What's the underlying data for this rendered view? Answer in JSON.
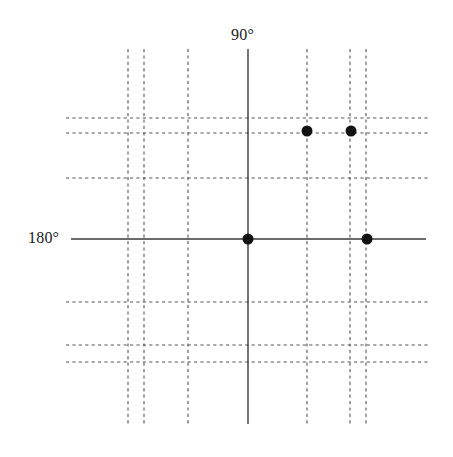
{
  "figure": {
    "title": "",
    "background_color": "#ffffff",
    "width": 453,
    "height": 457
  },
  "labels": {
    "top_axis": "90°",
    "left_axis": "180°"
  },
  "chart_data": {
    "type": "scatter",
    "title": "",
    "subtitle": "",
    "xlabel": "",
    "ylabel": "",
    "axis_labels": [
      "90°",
      "180°"
    ],
    "annotations": [
      {
        "text": "90°",
        "x": 248,
        "y": 37,
        "anchor": "middle",
        "role": "vertical-axis-label"
      },
      {
        "text": "180°",
        "x": 52,
        "y": 239,
        "anchor": "middle",
        "role": "horizontal-axis-label"
      }
    ],
    "grid": true,
    "grid_style": "dashed",
    "grid_color": "#555555",
    "legend": false,
    "axes": {
      "vertical_solid": {
        "x": 248,
        "y_start": 49,
        "y_end": 424,
        "color": "#3a3a3a",
        "width": 1.4
      },
      "horizontal_solid": {
        "y": 239,
        "x_start": 71,
        "x_end": 426,
        "color": "#3a3a3a",
        "width": 1.4
      }
    },
    "xlim": [
      66,
      428
    ],
    "ylim": [
      49,
      424
    ],
    "gridlines_x": [
      128,
      144,
      188,
      307,
      350,
      366
    ],
    "gridlines_y": [
      118,
      133,
      178,
      302,
      345,
      362
    ],
    "gridline_extent_x": [
      66,
      428
    ],
    "gridline_extent_y": [
      49,
      424
    ],
    "marker": {
      "shape": "circle",
      "color": "#121212",
      "radius": 5.5
    },
    "points": [
      {
        "x": 307,
        "y": 131,
        "label": ""
      },
      {
        "x": 351,
        "y": 131,
        "label": ""
      },
      {
        "x": 248,
        "y": 239,
        "label": ""
      },
      {
        "x": 367,
        "y": 239,
        "label": ""
      }
    ],
    "values": [
      {
        "px_x": 307,
        "px_y": 131
      },
      {
        "px_x": 351,
        "px_y": 131
      },
      {
        "px_x": 248,
        "px_y": 239
      },
      {
        "px_x": 367,
        "px_y": 239
      }
    ]
  }
}
